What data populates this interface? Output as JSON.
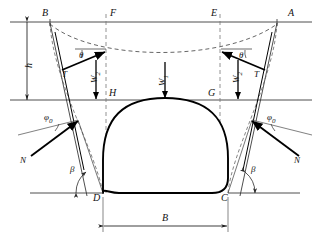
{
  "figure": {
    "type": "engineering-diagram",
    "colors": {
      "stroke_thin": "#3a3a3a",
      "stroke_bold": "#000000",
      "stroke_dashed": "#555555",
      "background": "#ffffff"
    }
  },
  "points": {
    "B": "B",
    "F": "F",
    "E": "E",
    "A": "A",
    "H": "H",
    "G": "G",
    "D": "D",
    "C": "C"
  },
  "angles": {
    "theta_left": "θ",
    "theta_right": "θ",
    "phi0_left": "φ",
    "phi0_left_sub": "0",
    "phi0_right": "φ",
    "phi0_right_sub": "0",
    "beta_left": "β",
    "beta_right": "β"
  },
  "forces": {
    "T_left": "T",
    "T_right": "T",
    "N_left": "N",
    "N_right": "N",
    "W2_left": "W",
    "W2_left_sub": "2",
    "W1_center": "W",
    "W1_center_sub": "1",
    "W2_right": "W",
    "W2_right_sub": "2"
  },
  "dimensions": {
    "height_h": "h",
    "width_B": "B"
  }
}
